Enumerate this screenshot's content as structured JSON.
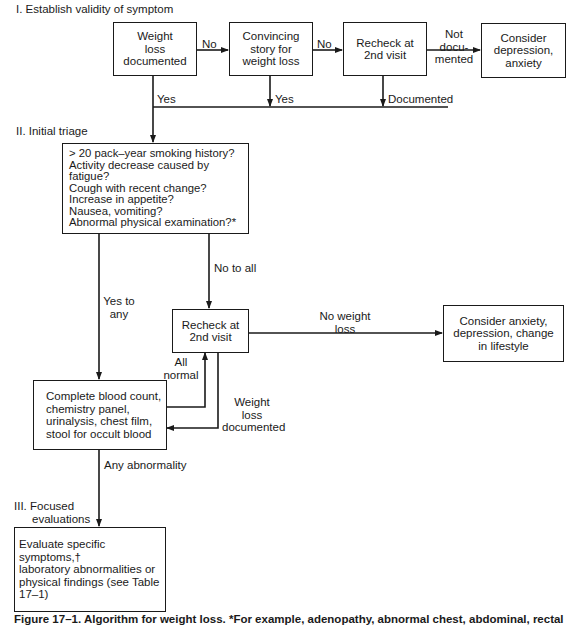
{
  "sections": {
    "s1": "I.  Establish validity of symptom",
    "s2": "II.   Initial triage",
    "s3_line1": "III.  Focused",
    "s3_line2": "evaluations"
  },
  "nodes": {
    "weight_loss_documented": "Weight\nloss\ndocumented",
    "convincing_story": "Convincing\nstory for\nweight loss",
    "recheck_top": "Recheck at\n2nd visit",
    "consider_depression_anxiety": "Consider\ndepression,\nanxiety",
    "triage_questions": "> 20 pack–year smoking history?\nActivity decrease caused by fatigue?\nCough with recent change?\nIncrease in appetite?\nNausea, vomiting?\nAbnormal physical examination?*",
    "recheck_middle": "Recheck at\n2nd visit",
    "consider_anxiety_lifestyle": "Consider anxiety,\ndepression, change\nin lifestyle",
    "lab_tests": "Complete blood count,\nchemistry panel,\nurinalysis, chest film,\nstool for occult blood",
    "evaluate_specific": "Evaluate specific symptoms,†\nlaboratory abnormalities or\nphysical findings (see Table 17–1)"
  },
  "edges": {
    "no_1": "No",
    "no_2": "No",
    "not_documented": "Not\ndocu-\nmented",
    "yes_1": "Yes",
    "yes_2": "Yes",
    "documented": "Documented",
    "yes_to_any": "Yes to\nany",
    "no_to_all": "No to all",
    "no_weight_loss": "No weight\nloss",
    "all_normal": "All\nnormal",
    "weight_loss_documented": "Weight\nloss\ndocumented",
    "any_abnormality": "Any abnormality"
  },
  "caption": "Figure 17–1.  Algorithm for weight loss.  *For example, adenopathy, abnormal chest, abdominal, rectal"
}
